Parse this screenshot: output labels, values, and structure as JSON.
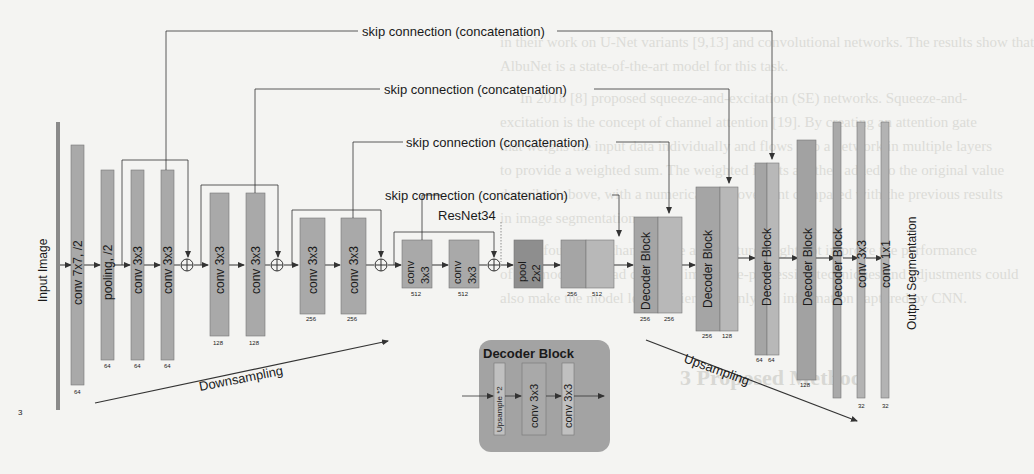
{
  "background_text": {
    "lines": [
      {
        "text": "in their work on U-Net variants [9,13] and convolutional networks. The results show that",
        "x": 500,
        "y": 44
      },
      {
        "text": "AlbuNet is a state-of-the-art model for this task.",
        "x": 500,
        "y": 68
      },
      {
        "text": "In 2018 [8] proposed squeeze-and-excitation (SE) networks. Squeeze-and-",
        "x": 520,
        "y": 100
      },
      {
        "text": "excitation is the concept of channel attention [19]. By creating an attention gate",
        "x": 500,
        "y": 124
      },
      {
        "text": "that weighs the input data individually and flows into a network in multiple layers",
        "x": 500,
        "y": 148
      },
      {
        "text": "to provide a weighted sum. The weighted inputs are then added to the original value",
        "x": 500,
        "y": 172
      },
      {
        "text": "described above, with a numerical improvement compared with the previous results",
        "x": 500,
        "y": 196
      },
      {
        "text": "in image segmentation.",
        "x": 500,
        "y": 220
      },
      {
        "text": "We found that changing the architecture might not improve the performance",
        "x": 520,
        "y": 252
      },
      {
        "text": "of the model; instead data and image pre-processing techniques and adjustments could",
        "x": 500,
        "y": 276
      },
      {
        "text": "also make the model learn easier with only the information captured by CNN.",
        "x": 500,
        "y": 300
      }
    ],
    "heading": {
      "text": "3   Proposed Method",
      "x": 680,
      "y": 386
    },
    "page_number": "3"
  },
  "diagram": {
    "skip_connections": [
      {
        "label": "skip connection (concatenation)"
      },
      {
        "label": "skip connection (concatenation)"
      },
      {
        "label": "skip connection (concatenation)"
      },
      {
        "label": "skip connection (concatenation)"
      }
    ],
    "encoder_label": "ResNet34",
    "input_label": "Input Image",
    "output_label": "Output Segmentation",
    "downsampling_label": "Downsampling",
    "upsampling_label": "Upsampling",
    "encoder_layers": [
      {
        "label": "conv 7x7, /2",
        "channels": "64"
      },
      {
        "label": "pooling, /2",
        "channels": "64"
      },
      {
        "label": "conv 3x3",
        "channels": "64"
      },
      {
        "label": "conv 3x3",
        "channels": "64"
      },
      {
        "label": "conv 3x3",
        "channels": "128"
      },
      {
        "label": "conv 3x3",
        "channels": "128"
      },
      {
        "label": "conv 3x3",
        "channels": "256"
      },
      {
        "label": "conv 3x3",
        "channels": "256"
      },
      {
        "label": "conv",
        "label2": "3x3",
        "channels": "512"
      },
      {
        "label": "conv",
        "label2": "3x3",
        "channels": "512"
      },
      {
        "label": "pool",
        "label2": "2x2",
        "channels": ""
      }
    ],
    "bottleneck": {
      "channels_left": "256",
      "channels_right": "512"
    },
    "decoder_layers": [
      {
        "label": "Decoder Block",
        "channels_left": "256",
        "channels_right": "256"
      },
      {
        "label": "Decoder Block",
        "channels_left": "256",
        "channels_right": "128"
      },
      {
        "label": "Decoder Block",
        "channels_left": "64",
        "channels_right": "64"
      },
      {
        "label": "Decoder Block",
        "channels": "128"
      },
      {
        "label": "Decoder Block",
        "channels": ""
      },
      {
        "label": "conv 3x3",
        "channels": "32"
      },
      {
        "label": "conv 1x1",
        "channels": "32"
      }
    ],
    "decoder_block_legend": {
      "title": "Decoder Block",
      "items": [
        "Upsample *2",
        "conv 3x3",
        "conv 3x3"
      ]
    }
  }
}
